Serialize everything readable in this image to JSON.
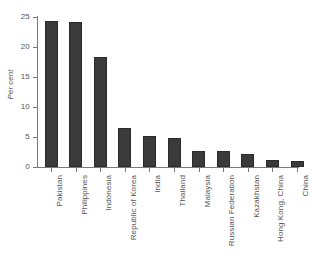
{
  "chart_data": {
    "type": "bar",
    "title": "",
    "xlabel": "",
    "ylabel": "Per cent",
    "ylim": [
      0,
      25
    ],
    "yticks": [
      0,
      5,
      10,
      15,
      20,
      25
    ],
    "ytick_labels": [
      "0",
      "5",
      "10",
      "15",
      "20",
      "25"
    ],
    "grid": false,
    "legend": false,
    "orientation": "vertical",
    "bar_color": "#3a3a3a",
    "axis_color": "#7a7a7a",
    "text_color": "#555555",
    "background": "#ffffff",
    "categories": [
      "Pakistan",
      "Philippines",
      "Indonesia",
      "Republic of Korea",
      "India",
      "Thailand",
      "Malaysia",
      "Russian Federation",
      "Kazakhstan",
      "Hong Kong, China",
      "China"
    ],
    "values": [
      24.3,
      24.1,
      18.3,
      6.5,
      5.2,
      4.9,
      2.7,
      2.6,
      2.1,
      1.2,
      1.0
    ]
  }
}
